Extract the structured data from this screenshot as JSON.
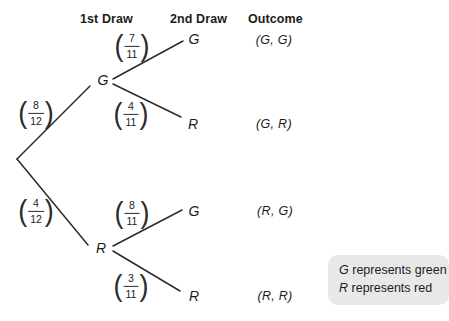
{
  "columns": {
    "first": "1st Draw",
    "second": "2nd Draw",
    "outcome": "Outcome"
  },
  "branches": {
    "first_draw": [
      {
        "label": "G",
        "prob_num": "8",
        "prob_den": "12"
      },
      {
        "label": "R",
        "prob_num": "4",
        "prob_den": "12"
      }
    ],
    "second_draw": [
      {
        "from": "G",
        "label": "G",
        "prob_num": "7",
        "prob_den": "11",
        "outcome": "(G, G)"
      },
      {
        "from": "G",
        "label": "R",
        "prob_num": "4",
        "prob_den": "11",
        "outcome": "(G, R)"
      },
      {
        "from": "R",
        "label": "G",
        "prob_num": "8",
        "prob_den": "11",
        "outcome": "(R, G)"
      },
      {
        "from": "R",
        "label": "R",
        "prob_num": "3",
        "prob_den": "11",
        "outcome": "(R, R)"
      }
    ]
  },
  "legend": {
    "items": [
      {
        "symbol": "G",
        "description": "represents green"
      },
      {
        "symbol": "R",
        "description": "represents red"
      }
    ]
  },
  "colors": {
    "line": "#2c2c2c",
    "text": "#1c1c1c",
    "legend_bg": "#e8e8e8"
  }
}
